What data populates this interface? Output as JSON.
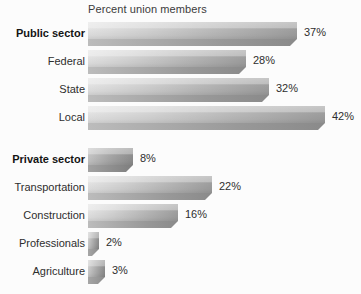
{
  "chart_data": {
    "type": "bar",
    "orientation": "horizontal",
    "title": "Percent union members",
    "xlabel": "",
    "ylabel": "",
    "xlim": [
      0,
      42
    ],
    "grid": false,
    "legend": false,
    "value_suffix": "%",
    "categories": [
      "Public sector",
      "Federal",
      "State",
      "Local",
      "Private sector",
      "Transportation",
      "Construction",
      "Professionals",
      "Agriculture"
    ],
    "values": [
      37,
      28,
      32,
      42,
      8,
      22,
      16,
      2,
      3
    ],
    "value_labels": [
      "37%",
      "28%",
      "32%",
      "42%",
      "8%",
      "22%",
      "16%",
      "2%",
      "3%"
    ],
    "groups": [
      {
        "name": "Public sector",
        "items": [
          {
            "label": "Public sector",
            "value": 37,
            "value_label": "37%",
            "emphasis": "group"
          },
          {
            "label": "Federal",
            "value": 28,
            "value_label": "28%",
            "emphasis": "item"
          },
          {
            "label": "State",
            "value": 32,
            "value_label": "32%",
            "emphasis": "item"
          },
          {
            "label": "Local",
            "value": 42,
            "value_label": "42%",
            "emphasis": "item"
          }
        ]
      },
      {
        "name": "Private sector",
        "items": [
          {
            "label": "Private sector",
            "value": 8,
            "value_label": "8%",
            "emphasis": "group"
          },
          {
            "label": "Transportation",
            "value": 22,
            "value_label": "22%",
            "emphasis": "item"
          },
          {
            "label": "Construction",
            "value": 16,
            "value_label": "16%",
            "emphasis": "item"
          },
          {
            "label": "Professionals",
            "value": 2,
            "value_label": "2%",
            "emphasis": "item"
          },
          {
            "label": "Agriculture",
            "value": 3,
            "value_label": "3%",
            "emphasis": "item"
          }
        ]
      }
    ]
  },
  "style": {
    "background": "#fcfcfc",
    "bar_light": "#e3e3e3",
    "bar_dark": "#9e9e9e",
    "bar_shadow": "#8a8a8a",
    "text_color": "#2e2e2e"
  }
}
